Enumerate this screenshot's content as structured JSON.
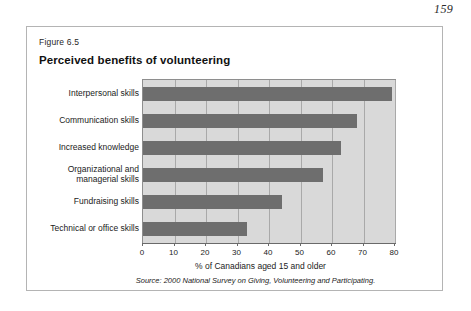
{
  "page": {
    "page_number": "159"
  },
  "figure": {
    "figure_number": "Figure 6.5",
    "title": "Perceived benefits of volunteering",
    "source_note": "Source: 2000 National Survey on Giving, Volunteering and Participating.",
    "colors": {
      "bar": "#6e6e6e",
      "plot_background": "#d9d9d9",
      "gridline": "#a9a9a9",
      "frame_border": "#b4b4b4"
    }
  },
  "chart_data": {
    "type": "bar",
    "orientation": "horizontal",
    "title": "Perceived benefits of volunteering",
    "xlabel": "% of Canadians aged 15 and older",
    "ylabel": "",
    "xlim": [
      0,
      80
    ],
    "xticks": [
      0,
      10,
      20,
      30,
      40,
      50,
      60,
      70,
      80
    ],
    "xtick_labels": [
      "0",
      "10",
      "20",
      "30",
      "40",
      "50",
      "60",
      "70",
      "80"
    ],
    "grid": true,
    "legend": false,
    "categories": [
      "Interpersonal skills",
      "Communication skills",
      "Increased knowledge",
      "Organizational and managerial skills",
      "Fundraising skills",
      "Technical or office skills"
    ],
    "category_lines": [
      [
        "Interpersonal skills"
      ],
      [
        "Communication skills"
      ],
      [
        "Increased knowledge"
      ],
      [
        "Organizational and",
        "managerial skills"
      ],
      [
        "Fundraising skills"
      ],
      [
        "Technical or office skills"
      ]
    ],
    "values": [
      79,
      68,
      63,
      57,
      44,
      33
    ],
    "source": "2000 National Survey on Giving, Volunteering and Participating."
  }
}
